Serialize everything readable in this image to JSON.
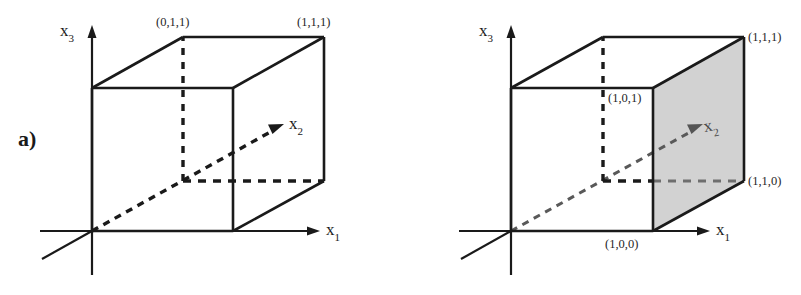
{
  "figure": {
    "background_color": "#ffffff",
    "line_color": "#1a1a1a",
    "shaded_face_color": "#d2d2d2",
    "panels": [
      {
        "id": "a",
        "letter": "a)",
        "axes": [
          {
            "name": "x3",
            "label_base": "x",
            "label_sub": "3"
          },
          {
            "name": "x2",
            "label_base": "x",
            "label_sub": "2"
          },
          {
            "name": "x1",
            "label_base": "x",
            "label_sub": "1"
          }
        ],
        "vertex_labels": [
          {
            "name": "vertex-011",
            "text": "(0,1,1)"
          },
          {
            "name": "vertex-111",
            "text": "(1,1,1)"
          }
        ],
        "shaded_faces": []
      },
      {
        "id": "b",
        "letter": "b)",
        "axes": [
          {
            "name": "x3",
            "label_base": "x",
            "label_sub": "3"
          },
          {
            "name": "x2",
            "label_base": "x",
            "label_sub": "2"
          },
          {
            "name": "x1",
            "label_base": "x",
            "label_sub": "1"
          }
        ],
        "vertex_labels": [
          {
            "name": "vertex-111",
            "text": "(1,1,1)"
          },
          {
            "name": "vertex-101",
            "text": "(1,0,1)"
          },
          {
            "name": "vertex-110",
            "text": "(1,1,0)"
          },
          {
            "name": "vertex-100",
            "text": "(1,0,0)"
          }
        ],
        "shaded_faces": [
          {
            "name": "face-x1-equals-1",
            "fill": "#d2d2d2"
          }
        ]
      }
    ]
  }
}
